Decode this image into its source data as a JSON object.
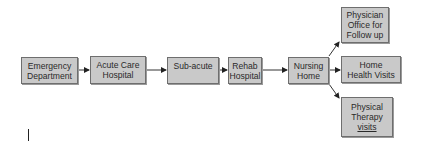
{
  "diagram": {
    "type": "flowchart",
    "direction": "left-to-right",
    "colors": {
      "node_fill": "#c9c9c9",
      "node_border": "#6e6e6e",
      "arrow": "#222222",
      "text": "#2a2a2a"
    },
    "nodes": [
      {
        "id": "emergency",
        "label": "Emergency\nDepartment"
      },
      {
        "id": "acute",
        "label": "Acute Care\nHospital"
      },
      {
        "id": "subacute",
        "label": "Sub-acute"
      },
      {
        "id": "rehab",
        "label": "Rehab\nHospital"
      },
      {
        "id": "nursing",
        "label": "Nursing\nHome"
      },
      {
        "id": "physician",
        "label": "Physician\nOffice for\nFollow up"
      },
      {
        "id": "homehealth",
        "label": "Home\nHealth Visits"
      },
      {
        "id": "therapy",
        "label_main": "Physical\nTherapy",
        "label_underlined": "visits"
      }
    ],
    "edges": [
      {
        "from": "emergency",
        "to": "acute"
      },
      {
        "from": "acute",
        "to": "subacute"
      },
      {
        "from": "subacute",
        "to": "rehab"
      },
      {
        "from": "rehab",
        "to": "nursing"
      },
      {
        "from": "nursing",
        "to": "physician"
      },
      {
        "from": "nursing",
        "to": "homehealth"
      },
      {
        "from": "nursing",
        "to": "therapy"
      }
    ]
  }
}
